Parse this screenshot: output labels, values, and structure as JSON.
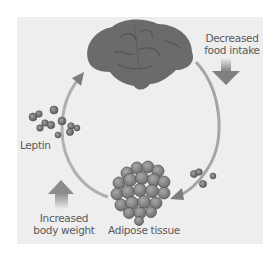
{
  "diagram": {
    "type": "cycle",
    "nodes": {
      "brain": {
        "label": ""
      },
      "adipose": {
        "label": "Adipose tissue"
      },
      "leptin": {
        "label": "Leptin"
      }
    },
    "annotations": {
      "decreased_intake": {
        "line1": "Decreased",
        "line2": "food intake",
        "arrow": "down"
      },
      "increased_weight": {
        "line1": "Increased",
        "line2": "body weight",
        "arrow": "up"
      }
    },
    "colors": {
      "background": "#ffffff",
      "panel": "#eeeeee",
      "cycle_arrow": "#9a9a9a",
      "brain": "#6b6b6b",
      "adipose": "#7a7a7a",
      "label_text": "#5a5a5a"
    }
  }
}
